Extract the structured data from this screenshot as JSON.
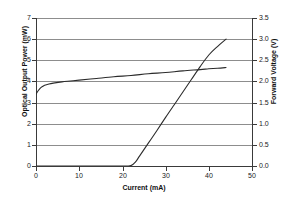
{
  "chart_data": {
    "type": "line",
    "title": "",
    "subtitle": "",
    "xlabel": "Current (mA)",
    "ylabel": "Optical Output Power (mW)",
    "y2label": "Forward Voltage (V)",
    "xlim": [
      0,
      50
    ],
    "ylim": [
      0,
      7
    ],
    "y2lim": [
      0.0,
      3.5
    ],
    "grid": true,
    "grid_orientation": "horizontal",
    "legend": "none",
    "background": "#ffffff",
    "line_color": "#2b2b2b",
    "axis_color": "#3a3a3a",
    "grid_color": "#8d8d8d",
    "xticks": [
      0,
      10,
      20,
      30,
      40,
      50
    ],
    "xtick_labels": [
      "0",
      "10",
      "20",
      "30",
      "40",
      "50"
    ],
    "yticks": [
      0,
      1,
      2,
      3,
      4,
      5,
      6,
      7
    ],
    "ytick_labels": [
      "0",
      "1",
      "2",
      "3",
      "4",
      "5",
      "6",
      "7"
    ],
    "y2ticks": [
      0.0,
      0.5,
      1.0,
      1.5,
      2.0,
      2.5,
      3.0,
      3.5
    ],
    "y2tick_labels": [
      "0.0",
      "0.5",
      "1.0",
      "1.5",
      "2.0",
      "2.5",
      "3.0",
      "3.5"
    ],
    "series": [
      {
        "name": "Optical Output Power",
        "axis": "left",
        "units": "mW",
        "x": [
          0,
          4,
          8,
          12,
          16,
          20,
          21,
          22,
          23,
          24,
          26,
          28,
          30,
          32,
          34,
          36,
          38,
          40,
          42,
          44
        ],
        "values": [
          0,
          0,
          0,
          0,
          0,
          0,
          0,
          0.02,
          0.18,
          0.48,
          1.08,
          1.68,
          2.3,
          2.9,
          3.5,
          4.1,
          4.7,
          5.25,
          5.65,
          6.0
        ]
      },
      {
        "name": "Forward Voltage",
        "axis": "right",
        "units": "V",
        "x": [
          0,
          0.5,
          1,
          1.5,
          2,
          3,
          4,
          6,
          8,
          10,
          14,
          18,
          22,
          26,
          30,
          34,
          38,
          40,
          42,
          44
        ],
        "values": [
          1.7,
          1.78,
          1.84,
          1.88,
          1.91,
          1.94,
          1.96,
          1.99,
          2.01,
          2.03,
          2.07,
          2.11,
          2.14,
          2.18,
          2.21,
          2.25,
          2.28,
          2.3,
          2.31,
          2.33
        ]
      }
    ],
    "annotations": {
      "threshold_current_mA": 22,
      "max_power_mW": 6.0,
      "max_current_mA": 44
    }
  }
}
